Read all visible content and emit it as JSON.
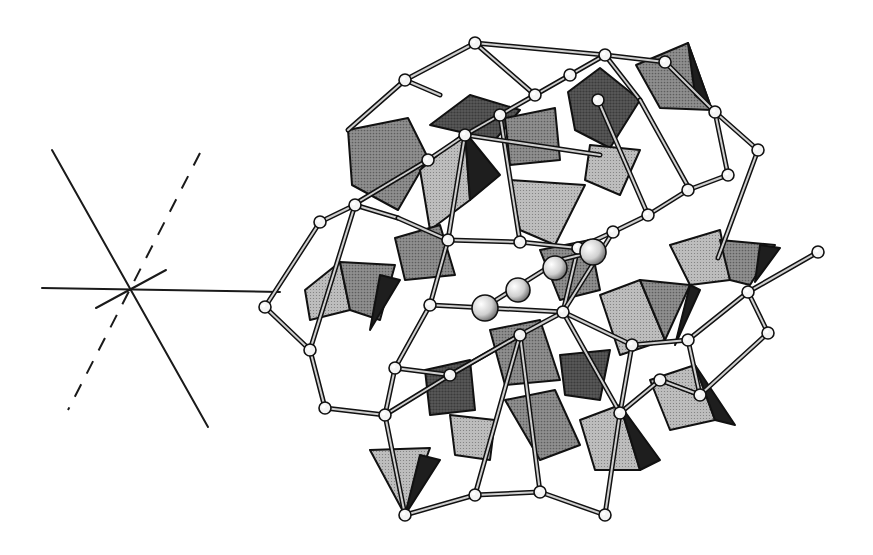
{
  "figure": {
    "width": 873,
    "height": 555,
    "background": "#ffffff"
  },
  "colors": {
    "ink": "#111111",
    "light_face": "#bdbdbd",
    "medium_face": "#8f8f8f",
    "dark_face": "#5a5a5a",
    "black_face": "#1e1e1e",
    "atom_fill": "#f4f4f4",
    "cation_fill": "#d0d0d0"
  },
  "axes": {
    "origin": [
      130,
      290
    ],
    "lines": [
      {
        "name": "horizontal-axis",
        "x1": 42,
        "y1": 288,
        "x2": 280,
        "y2": 292,
        "style": "solid"
      },
      {
        "name": "steep-axis",
        "x1": 52,
        "y1": 150,
        "x2": 208,
        "y2": 427,
        "style": "solid"
      },
      {
        "name": "short-axis",
        "x1": 96,
        "y1": 308,
        "x2": 166,
        "y2": 270,
        "style": "solid"
      },
      {
        "name": "dashed-axis",
        "x1": 200,
        "y1": 153,
        "x2": 68,
        "y2": 410,
        "style": "dashed"
      }
    ]
  },
  "polyhedra": [
    {
      "points": "348,130 408,118 428,158 398,210 352,185",
      "shade": "medium_face"
    },
    {
      "points": "430,125 470,95 520,110 495,140",
      "shade": "dark_face"
    },
    {
      "points": "420,170 465,132 470,200 430,230",
      "shade": "light_face"
    },
    {
      "points": "465,132 500,175 470,200",
      "shade": "black_face"
    },
    {
      "points": "505,118 555,108 560,160 510,165",
      "shade": "medium_face"
    },
    {
      "points": "568,92 600,68 640,100 610,148 575,130",
      "shade": "dark_face"
    },
    {
      "points": "590,145 640,150 620,195 585,180",
      "shade": "light_face"
    },
    {
      "points": "636,65 688,43 712,110 660,108",
      "shade": "medium_face"
    },
    {
      "points": "688,43 712,110 695,95",
      "shade": "black_face"
    },
    {
      "points": "510,180 585,185 555,245 520,230",
      "shade": "light_face"
    },
    {
      "points": "395,238 440,225 455,275 405,280",
      "shade": "medium_face"
    },
    {
      "points": "305,290 340,262 350,310 310,320",
      "shade": "light_face"
    },
    {
      "points": "340,262 395,265 380,320 350,310",
      "shade": "medium_face"
    },
    {
      "points": "380,275 400,280 370,330",
      "shade": "black_face"
    },
    {
      "points": "600,295 640,280 665,340 620,355",
      "shade": "light_face"
    },
    {
      "points": "640,280 690,285 665,340",
      "shade": "medium_face"
    },
    {
      "points": "690,285 700,290 675,345",
      "shade": "black_face"
    },
    {
      "points": "670,245 720,230 730,280 690,285",
      "shade": "light_face"
    },
    {
      "points": "720,240 775,245 750,285 730,280",
      "shade": "medium_face"
    },
    {
      "points": "760,245 780,248 755,282",
      "shade": "black_face"
    },
    {
      "points": "425,370 470,360 475,410 430,415",
      "shade": "dark_face"
    },
    {
      "points": "490,330 540,320 560,380 505,385",
      "shade": "medium_face"
    },
    {
      "points": "450,415 495,420 490,460 455,455",
      "shade": "light_face"
    },
    {
      "points": "505,400 555,390 580,445 540,460",
      "shade": "medium_face"
    },
    {
      "points": "580,420 620,405 640,470 595,470",
      "shade": "light_face"
    },
    {
      "points": "620,405 660,460 640,470",
      "shade": "black_face"
    },
    {
      "points": "650,380 695,365 715,420 670,430",
      "shade": "light_face"
    },
    {
      "points": "695,365 735,425 715,420",
      "shade": "black_face"
    },
    {
      "points": "370,450 430,448 405,515",
      "shade": "light_face"
    },
    {
      "points": "420,455 440,460 405,515",
      "shade": "black_face"
    },
    {
      "points": "560,355 610,350 600,400 565,395",
      "shade": "dark_face"
    },
    {
      "points": "540,250 590,240 600,290 560,300",
      "shade": "medium_face"
    }
  ],
  "bonds": [
    [
      405,
      80,
      475,
      43
    ],
    [
      475,
      43,
      535,
      95
    ],
    [
      405,
      80,
      348,
      130
    ],
    [
      405,
      80,
      440,
      95
    ],
    [
      475,
      43,
      605,
      55
    ],
    [
      535,
      95,
      570,
      75
    ],
    [
      570,
      75,
      605,
      55
    ],
    [
      605,
      55,
      665,
      62
    ],
    [
      605,
      55,
      640,
      100
    ],
    [
      665,
      62,
      715,
      112
    ],
    [
      715,
      112,
      758,
      150
    ],
    [
      715,
      112,
      728,
      175
    ],
    [
      758,
      150,
      718,
      258
    ],
    [
      728,
      175,
      688,
      190
    ],
    [
      688,
      190,
      648,
      215
    ],
    [
      648,
      215,
      613,
      232
    ],
    [
      613,
      232,
      578,
      248
    ],
    [
      578,
      248,
      563,
      312
    ],
    [
      563,
      312,
      520,
      335
    ],
    [
      520,
      335,
      450,
      375
    ],
    [
      450,
      375,
      395,
      368
    ],
    [
      395,
      368,
      385,
      415
    ],
    [
      385,
      415,
      325,
      408
    ],
    [
      325,
      408,
      310,
      350
    ],
    [
      310,
      350,
      265,
      307
    ],
    [
      265,
      307,
      320,
      222
    ],
    [
      320,
      222,
      355,
      205
    ],
    [
      355,
      205,
      398,
      218
    ],
    [
      398,
      218,
      448,
      240
    ],
    [
      448,
      240,
      520,
      242
    ],
    [
      520,
      242,
      578,
      248
    ],
    [
      448,
      240,
      465,
      135
    ],
    [
      465,
      135,
      500,
      115
    ],
    [
      500,
      115,
      535,
      95
    ],
    [
      428,
      160,
      465,
      135
    ],
    [
      353,
      205,
      428,
      160
    ],
    [
      563,
      312,
      613,
      232
    ],
    [
      563,
      312,
      632,
      345
    ],
    [
      632,
      345,
      688,
      340
    ],
    [
      688,
      340,
      748,
      292
    ],
    [
      748,
      292,
      818,
      252
    ],
    [
      748,
      292,
      768,
      333
    ],
    [
      768,
      333,
      700,
      395
    ],
    [
      700,
      395,
      660,
      380
    ],
    [
      660,
      380,
      620,
      413
    ],
    [
      620,
      413,
      605,
      515
    ],
    [
      605,
      515,
      540,
      492
    ],
    [
      540,
      492,
      475,
      495
    ],
    [
      475,
      495,
      405,
      515
    ],
    [
      405,
      515,
      385,
      415
    ],
    [
      540,
      492,
      520,
      335
    ],
    [
      620,
      413,
      563,
      312
    ],
    [
      450,
      375,
      520,
      335
    ],
    [
      700,
      395,
      688,
      340
    ],
    [
      632,
      345,
      620,
      413
    ],
    [
      598,
      100,
      648,
      215
    ],
    [
      430,
      305,
      563,
      312
    ],
    [
      395,
      368,
      430,
      305
    ],
    [
      430,
      305,
      448,
      240
    ],
    [
      480,
      310,
      560,
      260
    ],
    [
      560,
      260,
      600,
      250
    ],
    [
      640,
      100,
      690,
      190
    ],
    [
      500,
      115,
      520,
      242
    ],
    [
      465,
      135,
      600,
      155
    ],
    [
      355,
      205,
      310,
      350
    ],
    [
      385,
      415,
      450,
      375
    ],
    [
      660,
      380,
      700,
      395
    ],
    [
      475,
      495,
      520,
      335
    ]
  ],
  "atoms": [
    [
      475,
      43
    ],
    [
      605,
      55
    ],
    [
      665,
      62
    ],
    [
      405,
      80
    ],
    [
      535,
      95
    ],
    [
      570,
      75
    ],
    [
      500,
      115
    ],
    [
      598,
      100
    ],
    [
      465,
      135
    ],
    [
      715,
      112
    ],
    [
      758,
      150
    ],
    [
      428,
      160
    ],
    [
      728,
      175
    ],
    [
      688,
      190
    ],
    [
      355,
      205
    ],
    [
      648,
      215
    ],
    [
      613,
      232
    ],
    [
      578,
      248
    ],
    [
      448,
      240
    ],
    [
      520,
      242
    ],
    [
      320,
      222
    ],
    [
      265,
      307
    ],
    [
      818,
      252
    ],
    [
      748,
      292
    ],
    [
      768,
      333
    ],
    [
      688,
      340
    ],
    [
      632,
      345
    ],
    [
      563,
      312
    ],
    [
      520,
      335
    ],
    [
      430,
      305
    ],
    [
      395,
      368
    ],
    [
      450,
      375
    ],
    [
      310,
      350
    ],
    [
      325,
      408
    ],
    [
      385,
      415
    ],
    [
      700,
      395
    ],
    [
      660,
      380
    ],
    [
      620,
      413
    ],
    [
      540,
      492
    ],
    [
      475,
      495
    ],
    [
      605,
      515
    ],
    [
      405,
      515
    ],
    [
      480,
      310
    ]
  ],
  "cations": [
    {
      "cx": 485,
      "cy": 308,
      "r": 13
    },
    {
      "cx": 518,
      "cy": 290,
      "r": 12
    },
    {
      "cx": 555,
      "cy": 268,
      "r": 12
    },
    {
      "cx": 593,
      "cy": 252,
      "r": 13
    }
  ]
}
